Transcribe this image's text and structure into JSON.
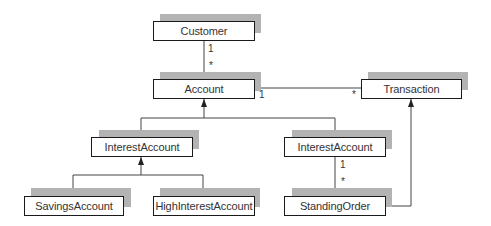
{
  "diagram": {
    "type": "UML class diagram",
    "classes": [
      {
        "id": "customer",
        "label": "Customer"
      },
      {
        "id": "account",
        "label": "Account"
      },
      {
        "id": "transaction",
        "label": "Transaction"
      },
      {
        "id": "interest_account_left",
        "label": "InterestAccount"
      },
      {
        "id": "interest_account_right",
        "label": "InterestAccount"
      },
      {
        "id": "savings_account",
        "label": "SavingsAccount"
      },
      {
        "id": "high_interest_account",
        "label": "HighInterestAccount"
      },
      {
        "id": "standing_order",
        "label": "StandingOrder"
      }
    ],
    "associations": [
      {
        "from": "Customer",
        "to": "Account",
        "from_mult": "1",
        "to_mult": "*"
      },
      {
        "from": "Account",
        "to": "Transaction",
        "from_mult": "1",
        "to_mult": "*"
      },
      {
        "from": "InterestAccount",
        "to": "StandingOrder",
        "from_mult": "1",
        "to_mult": "*"
      }
    ],
    "generalizations": [
      {
        "child": "InterestAccount",
        "parent": "Account"
      },
      {
        "child": "InterestAccount",
        "parent": "Account"
      },
      {
        "child": "SavingsAccount",
        "parent": "InterestAccount"
      },
      {
        "child": "HighInterestAccount",
        "parent": "InterestAccount"
      },
      {
        "child": "StandingOrder",
        "parent": "Transaction"
      }
    ],
    "multiplicities": {
      "customer_account_one": "1",
      "customer_account_many": "*",
      "account_transaction_one": "1",
      "account_transaction_many": "*",
      "interest_standing_one": "1",
      "interest_standing_many": "*"
    },
    "colors": {
      "box_border": "#1a1a1a",
      "shadow": "#b3b3b3",
      "line": "#333333",
      "text": "#333333"
    }
  }
}
